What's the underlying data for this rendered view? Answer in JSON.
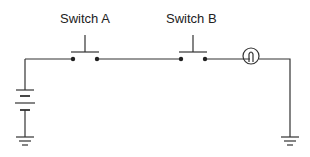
{
  "diagram": {
    "type": "circuit-schematic",
    "components": {
      "switch_a": {
        "label": "Switch A",
        "kind": "push-button-switch"
      },
      "switch_b": {
        "label": "Switch B",
        "kind": "push-button-switch"
      },
      "lamp": {
        "kind": "lamp"
      },
      "battery": {
        "kind": "battery"
      },
      "ground_left": {
        "kind": "ground"
      },
      "ground_right": {
        "kind": "ground"
      }
    },
    "colors": {
      "line": "#333333",
      "background": "#ffffff"
    }
  }
}
